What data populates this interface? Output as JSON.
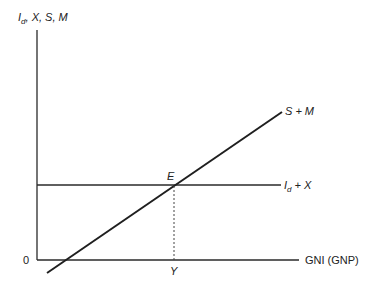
{
  "diagram": {
    "y_axis_label": {
      "main": "I",
      "subscript": "d",
      "rest": ", X, S, M"
    },
    "x_axis_label": "GNI (GNP)",
    "origin_label": "0",
    "lines": [
      {
        "id": "s-plus-m",
        "label": "S + M",
        "kind": "upward-sloping"
      },
      {
        "id": "id-plus-x",
        "label_main": "I",
        "label_sub": "d",
        "label_rest": " + X",
        "kind": "horizontal"
      }
    ],
    "equilibrium_point_label": "E",
    "equilibrium_income_label": "Y"
  }
}
